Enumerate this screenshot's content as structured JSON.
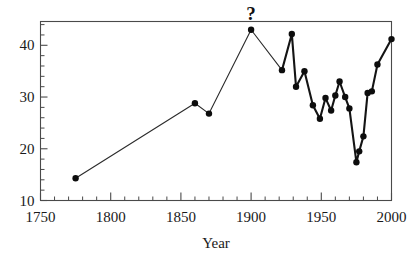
{
  "chart_data": {
    "type": "line",
    "title": "",
    "xlabel": "Year",
    "ylabel": "",
    "xlim": [
      1750,
      2000
    ],
    "ylim": [
      10,
      44.6
    ],
    "grid": false,
    "legend": "none",
    "x_major_ticks": [
      1750,
      1800,
      1850,
      1900,
      1950,
      2000
    ],
    "x_tick_labels": [
      "1750",
      "1800",
      "1850",
      "1900",
      "1950",
      "2000"
    ],
    "x_minor_step": 10,
    "y_major_ticks": [
      10,
      20,
      30,
      40
    ],
    "y_tick_labels": [
      "10",
      "20",
      "30",
      "40"
    ],
    "y_minor_step": 2,
    "marker": "filled-circle",
    "annotations": [
      {
        "text": "?",
        "x": 1900,
        "y": 44.0
      }
    ],
    "x": [
      1775,
      1860,
      1870,
      1900,
      1922,
      1929,
      1932,
      1936,
      1939,
      1944,
      1947,
      1950,
      1953,
      1956,
      1959,
      1962,
      1964,
      1967,
      1970,
      1973,
      1976,
      1978,
      1980,
      1982,
      1985,
      1988,
      1992,
      2000
    ],
    "values": [
      14.3,
      28.8,
      26.8,
      43.0,
      35.2,
      42.2,
      32.0,
      35.0,
      28.4,
      25.8,
      29.8,
      27.4,
      30.3,
      30.9,
      33.0,
      30.0,
      27.8,
      17.4,
      19.5,
      22.4,
      30.8,
      31.1,
      36.3,
      41.2,
      30.0,
      30.0,
      30.0,
      41.2
    ],
    "series": [
      {
        "name": "observed",
        "points": [
          {
            "x": 1775,
            "y": 14.3
          },
          {
            "x": 1860,
            "y": 28.8
          },
          {
            "x": 1870,
            "y": 26.8
          },
          {
            "x": 1900,
            "y": 43.0
          },
          {
            "x": 1922,
            "y": 35.2
          },
          {
            "x": 1929,
            "y": 42.2
          },
          {
            "x": 1932,
            "y": 32.0
          },
          {
            "x": 1938,
            "y": 35.0
          },
          {
            "x": 1944,
            "y": 28.4
          },
          {
            "x": 1949,
            "y": 25.8
          },
          {
            "x": 1953,
            "y": 29.8
          },
          {
            "x": 1957,
            "y": 27.4
          },
          {
            "x": 1960,
            "y": 30.3
          },
          {
            "x": 1963,
            "y": 33.0
          },
          {
            "x": 1967,
            "y": 30.0
          },
          {
            "x": 1970,
            "y": 27.8
          },
          {
            "x": 1975,
            "y": 17.4
          },
          {
            "x": 1977,
            "y": 19.5
          },
          {
            "x": 1980,
            "y": 22.4
          },
          {
            "x": 1983,
            "y": 30.8
          },
          {
            "x": 1986,
            "y": 31.1
          },
          {
            "x": 1990,
            "y": 36.3
          },
          {
            "x": 2000,
            "y": 41.2
          }
        ]
      }
    ],
    "thin_segment_range": [
      1775,
      1922
    ],
    "colors": {
      "line": "#141414",
      "marker": "#0d0d0d",
      "axis": "#4a4a4a",
      "text": "#1a1a1a",
      "background": "#ffffff"
    }
  }
}
